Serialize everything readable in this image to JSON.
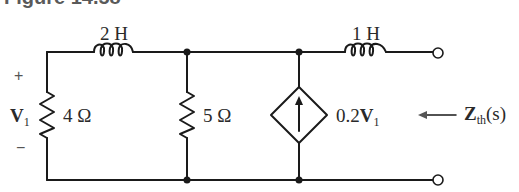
{
  "figure": {
    "title": "Figure 14.58"
  },
  "circuit": {
    "components": [
      {
        "id": "L1",
        "type": "inductor",
        "value": "2 H",
        "position": "top-left series"
      },
      {
        "id": "R1",
        "type": "resistor",
        "value": "4 Ω",
        "position": "left shunt",
        "voltage_label": "V1"
      },
      {
        "id": "R2",
        "type": "resistor",
        "value": "5 Ω",
        "position": "middle shunt"
      },
      {
        "id": "DS1",
        "type": "dependent-current-source",
        "value": "0.2V1",
        "direction": "up"
      },
      {
        "id": "L2",
        "type": "inductor",
        "value": "1 H",
        "position": "top-right series"
      }
    ],
    "terminals": 2
  },
  "labels": {
    "inductor_2h": "2 H",
    "inductor_1h": "1 H",
    "resistor_4": "4 Ω",
    "resistor_5": "5 Ω",
    "v1_main": "V",
    "v1_sub": "1",
    "plus": "+",
    "minus": "−",
    "source_coef": "0.2",
    "source_var": "V",
    "source_sub": "1",
    "zth_main": "Z",
    "zth_sub": "th",
    "zth_arg": "(s)"
  },
  "colors": {
    "wire": "#1a1a1a",
    "text": "#2a2a2a"
  }
}
